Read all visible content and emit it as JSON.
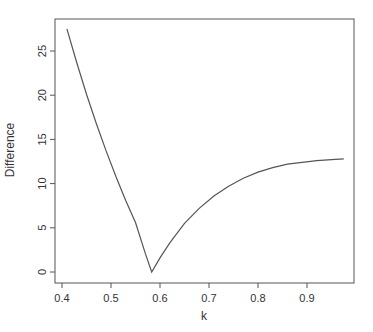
{
  "chart_data": {
    "type": "line",
    "title": "",
    "xlabel": "k",
    "ylabel": "Difference",
    "xlim": [
      0.385,
      0.995
    ],
    "ylim": [
      -1.2,
      28.7
    ],
    "xticks": [
      0.4,
      0.5,
      0.6,
      0.7,
      0.8,
      0.9
    ],
    "xtick_labels": [
      "0.4",
      "0.5",
      "0.6",
      "0.7",
      "0.8",
      "0.9"
    ],
    "yticks": [
      0,
      5,
      10,
      15,
      20,
      25
    ],
    "ytick_labels": [
      "0",
      "5",
      "10",
      "15",
      "20",
      "25"
    ],
    "grid": false,
    "legend": null,
    "series": [
      {
        "name": "Difference",
        "color": "#555555",
        "x": [
          0.41,
          0.43,
          0.45,
          0.47,
          0.49,
          0.51,
          0.53,
          0.55,
          0.57,
          0.583,
          0.6,
          0.62,
          0.65,
          0.68,
          0.71,
          0.74,
          0.77,
          0.8,
          0.83,
          0.86,
          0.89,
          0.92,
          0.95,
          0.975
        ],
        "y": [
          27.5,
          23.7,
          20.1,
          16.8,
          13.7,
          10.8,
          8.1,
          5.6,
          2.1,
          0.0,
          1.6,
          3.3,
          5.5,
          7.2,
          8.6,
          9.7,
          10.6,
          11.3,
          11.8,
          12.2,
          12.4,
          12.6,
          12.7,
          12.8
        ]
      }
    ]
  }
}
